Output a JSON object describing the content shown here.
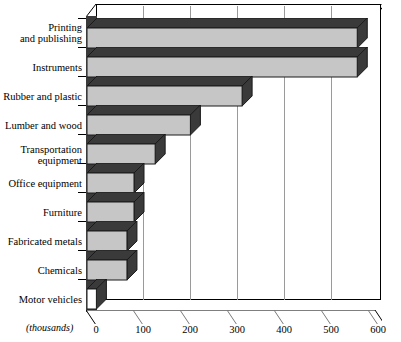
{
  "chart_data": {
    "type": "bar",
    "orientation": "horizontal",
    "title": "",
    "xlabel": "(thousands)",
    "ylabel": "",
    "categories": [
      "Printing\nand publishing",
      "Instruments",
      "Rubber and plastic",
      "Lumber and wood",
      "Transportation\nequipment",
      "Office equipment",
      "Furniture",
      "Fabricated metals",
      "Chemicals",
      "Motor vehicles"
    ],
    "values": [
      575,
      575,
      330,
      220,
      145,
      100,
      100,
      85,
      85,
      20
    ],
    "xlim": [
      0,
      600
    ],
    "xticks": [
      0,
      100,
      200,
      300,
      400,
      500,
      600
    ],
    "xtick_labels": [
      "0",
      "100",
      "200",
      "300",
      "400",
      "500",
      "600"
    ],
    "grid": "vertical",
    "legend": "none",
    "style3d": true,
    "colors": {
      "bar_face": "#c6c6c6",
      "bar_shadow": "#3a3a3a",
      "bar_outline": "#1a1a1a",
      "gridline": "#9a9a9a",
      "axis": "#000000",
      "background": "#ffffff",
      "motor_vehicles_face": "#ffffff"
    }
  },
  "units_note": "(thousands)"
}
